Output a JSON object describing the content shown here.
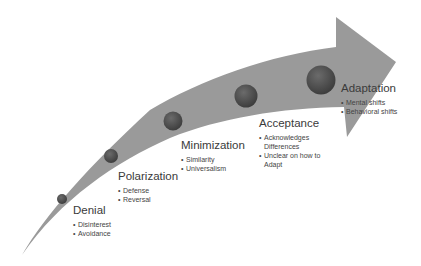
{
  "diagram": {
    "type": "stage-arrow",
    "colors": {
      "arrow_fill": "#9a9a9a",
      "node_fill": "#4a4a4a",
      "node_highlight": "#6b6b6b",
      "text": "#3a3a3a",
      "background": "#ffffff"
    },
    "stages": [
      {
        "title": "Denial",
        "bullets": [
          "Disinterest",
          "Avoidance"
        ]
      },
      {
        "title": "Polarization",
        "bullets": [
          "Defense",
          "Reversal"
        ]
      },
      {
        "title": "Minimization",
        "bullets": [
          "Similarity",
          "Universalism"
        ]
      },
      {
        "title": "Acceptance",
        "bullets": [
          "Acknowledges Differences",
          "Unclear on how to Adapt"
        ]
      },
      {
        "title": "Adaptation",
        "bullets": [
          "Mental shifts",
          "Behavioral shifts"
        ]
      }
    ]
  }
}
